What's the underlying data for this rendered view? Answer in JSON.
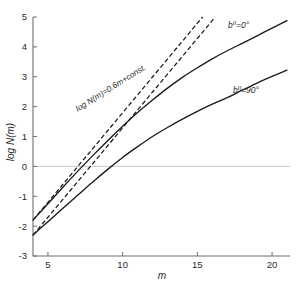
{
  "chart_data": {
    "type": "line",
    "title": "",
    "xlabel": "m",
    "ylabel": "log N(m)",
    "xlim": [
      4,
      21.2
    ],
    "ylim": [
      -3,
      5
    ],
    "grid": false,
    "zero_line": true,
    "legend_position": "inline-right",
    "xticks": [
      5,
      10,
      15,
      20
    ],
    "xticklabels": [
      "5",
      "10",
      "15",
      "20"
    ],
    "yticks": [
      -3,
      -2,
      -1,
      0,
      1,
      2,
      3,
      4,
      5
    ],
    "yticklabels": [
      "-3",
      "-2",
      "-1",
      "0",
      "1",
      "2",
      "3",
      "4",
      "5"
    ],
    "series": [
      {
        "name": "b-II = 0 deg",
        "style": "solid",
        "label": "bᴵᴵ=0°",
        "x": [
          4,
          5,
          6,
          7,
          8,
          9,
          10,
          11,
          12,
          13,
          14,
          15,
          16,
          17,
          18,
          19,
          20,
          21
        ],
        "y": [
          -1.8,
          -1.25,
          -0.7,
          -0.16,
          0.36,
          0.86,
          1.34,
          1.8,
          2.22,
          2.62,
          2.98,
          3.3,
          3.6,
          3.87,
          4.12,
          4.37,
          4.63,
          4.88
        ]
      },
      {
        "name": "b-II = 90 deg",
        "style": "solid",
        "label": "bᴵᴵ=90°",
        "x": [
          4,
          5,
          6,
          7,
          8,
          9,
          10,
          11,
          12,
          13,
          14,
          15,
          16,
          17,
          18,
          19,
          20,
          21
        ],
        "y": [
          -2.3,
          -1.85,
          -1.4,
          -0.96,
          -0.52,
          -0.1,
          0.3,
          0.66,
          1.0,
          1.3,
          1.58,
          1.84,
          2.08,
          2.3,
          2.55,
          2.79,
          3.01,
          3.22
        ]
      },
      {
        "name": "euclidean-slope-line-upper",
        "style": "dashed",
        "slope": 0.6,
        "x": [
          4,
          15.35
        ],
        "y": [
          -1.8,
          5.0
        ]
      },
      {
        "name": "euclidean-slope-line-lower",
        "style": "dashed",
        "slope": 0.6,
        "x": [
          4,
          16.2
        ],
        "y": [
          -2.3,
          5.0
        ]
      }
    ],
    "annotations": [
      {
        "name": "slope-equation",
        "text": "log N(m)=0.6m+const.",
        "x": 9.3,
        "y": 2.55,
        "rotation": -32
      }
    ]
  },
  "labels": {
    "xaxis_title": "m",
    "yaxis_title": "log N(m)",
    "curve_top_label_base": "b",
    "curve_top_label_sup": "II",
    "curve_top_label_value": "=0°",
    "curve_bottom_label_base": "b",
    "curve_bottom_label_sup": "II",
    "curve_bottom_label_value": "=90°",
    "slope_annotation": "log N(m)=0.6m+const."
  },
  "colors": {
    "curve": "#1a1a1a",
    "axis": "#6e6e6e",
    "zero_line": "#c9c9c9",
    "background": "#ffffff",
    "text": "#2a2a2a"
  }
}
